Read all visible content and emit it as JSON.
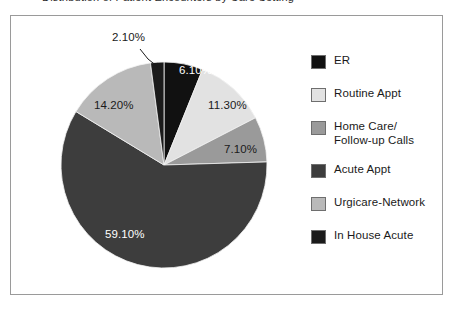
{
  "title": "Distribution of Patient Encounters by Care Setting",
  "frame": {
    "border_color": "#9a9a9a",
    "background": "#ffffff"
  },
  "chart_data": {
    "type": "pie",
    "title": "Distribution of Patient Encounters by Care Setting",
    "xlabel": "",
    "ylabel": "",
    "legend_position": "right",
    "start_angle_deg": 0,
    "direction": "clockwise",
    "categories": [
      "ER",
      "Routine Appt",
      "Home Care/\nFollow-up Calls",
      "Acute Appt",
      "Urgicare-Network",
      "In House Acute"
    ],
    "values": [
      6.1,
      11.3,
      7.1,
      59.1,
      14.2,
      2.1
    ],
    "value_labels": [
      "6.10%",
      "11.30%",
      "7.10%",
      "59.10%",
      "14.20%",
      "2.10%"
    ],
    "colors": [
      "#111111",
      "#e2e2e2",
      "#9a9a9a",
      "#3d3d3d",
      "#b9b9b9",
      "#1b1b1b"
    ],
    "label_text_colors": [
      "#ffffff",
      "#1a1a1a",
      "#1a1a1a",
      "#ffffff",
      "#1a1a1a",
      "#1a1a1a"
    ],
    "units": "percent"
  },
  "slices": [
    {
      "label": "6.10%",
      "name": "ER",
      "color": "#111111"
    },
    {
      "label": "11.30%",
      "name": "Routine Appt",
      "color": "#e2e2e2"
    },
    {
      "label": "7.10%",
      "name": "Home Care/Follow-up Calls",
      "color": "#9a9a9a"
    },
    {
      "label": "59.10%",
      "name": "Acute Appt",
      "color": "#3d3d3d"
    },
    {
      "label": "14.20%",
      "name": "Urgicare-Network",
      "color": "#b9b9b9"
    },
    {
      "label": "2.10%",
      "name": "In House Acute",
      "color": "#1b1b1b"
    }
  ],
  "legend": {
    "items": [
      {
        "label": "ER",
        "color": "#111111"
      },
      {
        "label": "Routine Appt",
        "color": "#e2e2e2"
      },
      {
        "label": "Home Care/\nFollow-up Calls",
        "color": "#9a9a9a"
      },
      {
        "label": "Acute Appt",
        "color": "#3d3d3d"
      },
      {
        "label": "Urgicare-Network",
        "color": "#b9b9b9"
      },
      {
        "label": "In House Acute",
        "color": "#1b1b1b"
      }
    ]
  }
}
